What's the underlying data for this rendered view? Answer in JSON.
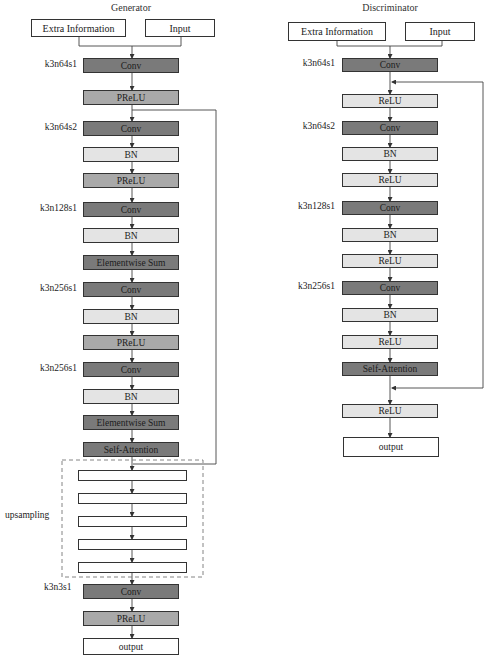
{
  "generator": {
    "title": "Generator",
    "inputs": [
      "Extra Information",
      "Input"
    ],
    "layers": [
      {
        "label": "Conv",
        "annotation": "k3n64s1",
        "shade": "dark"
      },
      {
        "label": "PReLU",
        "annotation": "",
        "shade": "mid"
      },
      {
        "label": "Conv",
        "annotation": "k3n64s2",
        "shade": "dark"
      },
      {
        "label": "BN",
        "annotation": "",
        "shade": "light"
      },
      {
        "label": "PReLU",
        "annotation": "",
        "shade": "mid"
      },
      {
        "label": "Conv",
        "annotation": "k3n128s1",
        "shade": "dark"
      },
      {
        "label": "BN",
        "annotation": "",
        "shade": "light"
      },
      {
        "label": "Elementwise Sum",
        "annotation": "",
        "shade": "dark"
      },
      {
        "label": "Conv",
        "annotation": "k3n256s1",
        "shade": "dark"
      },
      {
        "label": "BN",
        "annotation": "",
        "shade": "light"
      },
      {
        "label": "PReLU",
        "annotation": "",
        "shade": "mid"
      },
      {
        "label": "Conv",
        "annotation": "k3n256s1",
        "shade": "dark"
      },
      {
        "label": "BN",
        "annotation": "",
        "shade": "light"
      },
      {
        "label": "Elementwise Sum",
        "annotation": "",
        "shade": "dark"
      },
      {
        "label": "Self-Attention",
        "annotation": "",
        "shade": "dark"
      }
    ],
    "upsampling": {
      "label": "upsampling",
      "block_count": 5
    },
    "tail_layers": [
      {
        "label": "Conv",
        "annotation": "k3n3s1",
        "shade": "dark"
      },
      {
        "label": "PReLU",
        "annotation": "",
        "shade": "mid"
      },
      {
        "label": "output",
        "annotation": "",
        "shade": "white"
      }
    ],
    "skip_connection": {
      "from": "PReLU (layer 2)",
      "to": "after Self-Attention"
    }
  },
  "discriminator": {
    "title": "Discriminator",
    "inputs": [
      "Extra Information",
      "Input"
    ],
    "layers": [
      {
        "label": "Conv",
        "annotation": "k3n64s1",
        "shade": "dark"
      },
      {
        "label": "ReLU",
        "annotation": "",
        "shade": "light"
      },
      {
        "label": "Conv",
        "annotation": "k3n64s2",
        "shade": "dark"
      },
      {
        "label": "BN",
        "annotation": "",
        "shade": "light"
      },
      {
        "label": "ReLU",
        "annotation": "",
        "shade": "light"
      },
      {
        "label": "Conv",
        "annotation": "k3n128s1",
        "shade": "dark"
      },
      {
        "label": "BN",
        "annotation": "",
        "shade": "light"
      },
      {
        "label": "ReLU",
        "annotation": "",
        "shade": "light"
      },
      {
        "label": "Conv",
        "annotation": "k3n256s1",
        "shade": "dark"
      },
      {
        "label": "BN",
        "annotation": "",
        "shade": "light"
      },
      {
        "label": "ReLU",
        "annotation": "",
        "shade": "light"
      },
      {
        "label": "Self-Attention",
        "annotation": "",
        "shade": "dark"
      },
      {
        "label": "ReLU",
        "annotation": "",
        "shade": "light"
      },
      {
        "label": "output",
        "annotation": "",
        "shade": "white"
      }
    ],
    "skip_connection": {
      "from": "after first Conv",
      "to": "after Self-Attention"
    }
  },
  "colors": {
    "dark_block": "#7a7a7a",
    "mid_block": "#a9a9a9",
    "light_block": "#e4e4e4",
    "border": "#333333"
  }
}
